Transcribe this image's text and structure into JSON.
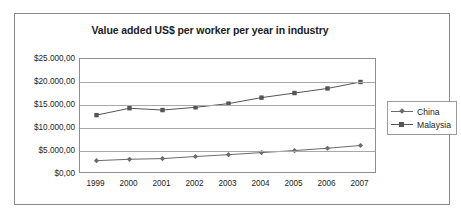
{
  "top_sliver": {
    "text": "·                                          ·        ·  ·                ·"
  },
  "legend": {
    "position": "right",
    "items": [
      {
        "label": "China",
        "marker": "diamond-marker-icon",
        "color": "#6b6b6b"
      },
      {
        "label": "Malaysia",
        "marker": "square-marker-icon",
        "color": "#555555"
      }
    ]
  },
  "chart_data": {
    "type": "line",
    "title": "Value added US$ per worker per year in industry",
    "xlabel": "",
    "ylabel": "",
    "categories": [
      "1999",
      "2000",
      "2001",
      "2002",
      "2003",
      "2004",
      "2005",
      "2006",
      "2007"
    ],
    "ylim": [
      0,
      25000
    ],
    "ytick_values": [
      0,
      5000,
      10000,
      15000,
      20000,
      25000
    ],
    "ytick_labels": [
      "$0,00",
      "$5.000,00",
      "$10.000,00",
      "$15.000,00",
      "$20.000,00",
      "$25.000,00"
    ],
    "grid": true,
    "legend_position": "right",
    "series": [
      {
        "name": "China",
        "marker": "diamond",
        "color": "#6b6b6b",
        "values": [
          2900,
          3200,
          3350,
          3800,
          4200,
          4650,
          5100,
          5600,
          6200
        ]
      },
      {
        "name": "Malaysia",
        "marker": "square",
        "color": "#555555",
        "values": [
          12800,
          14300,
          13900,
          14500,
          15300,
          16600,
          17600,
          18600,
          20000
        ]
      }
    ]
  }
}
